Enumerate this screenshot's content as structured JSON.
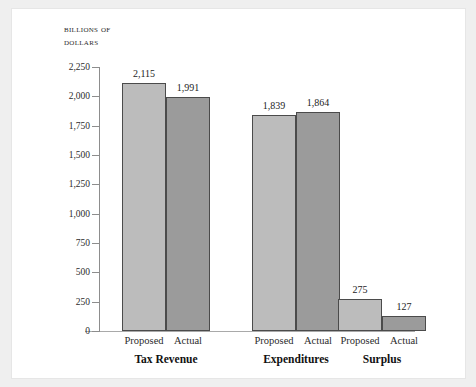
{
  "chart_data": {
    "type": "bar",
    "title": "",
    "subtitle": "",
    "unit_label_line1": "Billions of",
    "unit_label_line2": "dollars",
    "xlabel": "",
    "ylabel": "Billions of dollars",
    "ylim": [
      0,
      2250
    ],
    "ytick_step": 250,
    "grid": false,
    "legend": "none",
    "categories": [
      "Tax Revenue",
      "Expenditures",
      "Surplus"
    ],
    "series": [
      {
        "name": "Proposed",
        "values": [
          2115,
          1839,
          275
        ],
        "color": "#bcbcbc"
      },
      {
        "name": "Actual",
        "values": [
          1991,
          1864,
          127
        ],
        "color": "#9b9b9b"
      }
    ],
    "ytick_labels": [
      "0",
      "250",
      "500",
      "750",
      "1,000",
      "1,250",
      "1,500",
      "1,750",
      "2,000",
      "2,250"
    ],
    "ytick_values": [
      0,
      250,
      500,
      750,
      1000,
      1250,
      1500,
      1750,
      2000,
      2250
    ],
    "bar_value_labels": [
      [
        "2,115",
        "1,991"
      ],
      [
        "1,839",
        "1,864"
      ],
      [
        "275",
        "127"
      ]
    ],
    "series_labels_per_group": [
      [
        "Proposed",
        "Actual"
      ],
      [
        "Proposed",
        "Actual"
      ],
      [
        "Proposed",
        "Actual"
      ]
    ]
  },
  "colors": {
    "page_background": "#efefef",
    "panel_background": "#ffffff",
    "panel_border": "#e6e6e6",
    "axis": "#8d8d8d",
    "baseline": "#a9a9a9",
    "bar_outline": "#4b4b4b",
    "proposed_fill": "#bcbcbc",
    "actual_fill": "#9b9b9b",
    "text": "#1c1c1c"
  }
}
